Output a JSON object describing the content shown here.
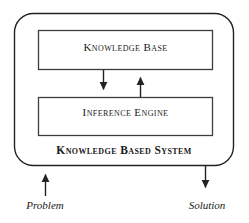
{
  "diagram": {
    "title": "Knowledge Based System",
    "type": "block-diagram",
    "outer_container": {
      "label": "Knowledge Based System",
      "shape": "rounded-rectangle",
      "stroke_color": "#222222"
    },
    "blocks": [
      {
        "id": "knowledge-base",
        "label": "Knowledge Base",
        "shape": "rectangle",
        "stroke_color": "#3a3a3a"
      },
      {
        "id": "inference-engine",
        "label": "Inference Engine",
        "shape": "rectangle",
        "stroke_color": "#3a3a3a"
      }
    ],
    "connectors": [
      {
        "id": "kb-to-ie",
        "from": "knowledge-base",
        "to": "inference-engine",
        "direction": "down"
      },
      {
        "id": "ie-to-kb",
        "from": "inference-engine",
        "to": "knowledge-base",
        "direction": "up"
      }
    ],
    "io": [
      {
        "id": "problem",
        "label": "Problem",
        "direction": "in",
        "arrow": "up"
      },
      {
        "id": "solution",
        "label": "Solution",
        "direction": "out",
        "arrow": "down"
      }
    ],
    "colors": {
      "background": "#ffffff",
      "line": "#222222",
      "text": "#1a1a1a"
    }
  }
}
